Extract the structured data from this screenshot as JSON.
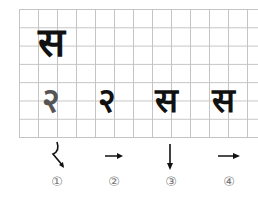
{
  "title_glyph": "स",
  "steps": [
    {
      "glyph": "२",
      "number": "①",
      "arrow": "curve-down-right"
    },
    {
      "glyph": "२",
      "number": "②",
      "arrow": "right"
    },
    {
      "glyph": "स",
      "number": "③",
      "arrow": "down"
    },
    {
      "glyph": "स",
      "number": "④",
      "arrow": "right"
    }
  ],
  "colors": {
    "grid": "#c4c4c4",
    "ink": "#111111",
    "number": "#777777"
  }
}
